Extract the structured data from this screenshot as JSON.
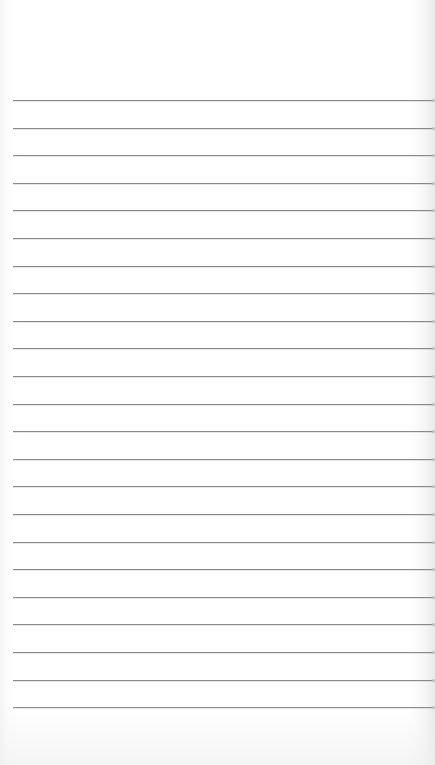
{
  "sheet": {
    "type": "lined-notepad-paper",
    "background_color": "#ffffff",
    "rule_color": "#8a8a8a",
    "rule_count": 23,
    "first_rule_y": 100,
    "rule_spacing": 27.6,
    "rule_left": 13,
    "rule_right": 433,
    "lines": []
  }
}
